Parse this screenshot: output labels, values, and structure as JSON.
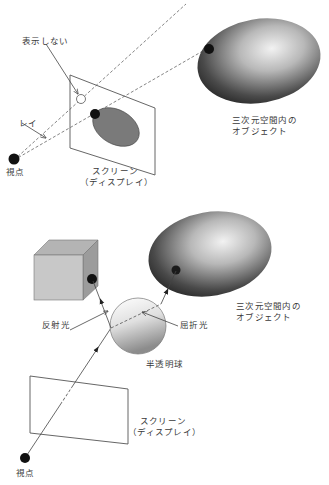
{
  "top_diagram": {
    "labels": {
      "not_displayed": "表示しない",
      "ray": "レイ",
      "viewpoint": "視点",
      "screen_line1": "スクリーン",
      "screen_line2": "（ディスプレイ）",
      "object_line1": "三次元空間内の",
      "object_line2": "オブジェクト"
    }
  },
  "bottom_diagram": {
    "labels": {
      "reflected_light": "反射光",
      "refracted_light": "屈折光",
      "translucent_sphere": "半透明球",
      "object_line1": "三次元空間内の",
      "object_line2": "オブジェクト",
      "screen_line1": "スクリーン",
      "screen_line2": "（ディスプレイ）",
      "viewpoint": "視点"
    }
  },
  "colors": {
    "line": "#555555",
    "dot": "#111111",
    "projected_ellipse": "#7a7a7a",
    "cube_front": "#c8c8c8",
    "cube_top": "#b4b4b4",
    "cube_side": "#9c9c9c"
  }
}
